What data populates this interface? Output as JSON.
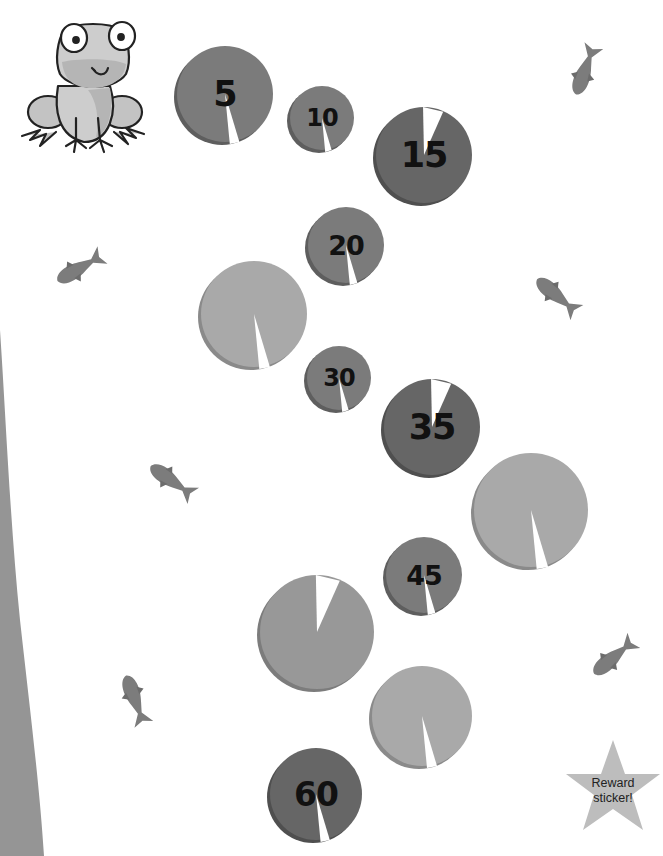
{
  "game": {
    "type": "lily-pad counting path (count by 5s)",
    "reward_label_line1": "Reward",
    "reward_label_line2": "sticker!"
  },
  "colors": {
    "background": "#ffffff",
    "pad_dark": "#6a6a6a",
    "pad_medium": "#7a7a7a",
    "pad_light": "#a8a8a8",
    "pad_edge_shadow": "#5a5a5a",
    "fish": "#7c7c7c",
    "bank": "#959595",
    "star": "#bdbdbd",
    "frog": "#c8c8c8"
  },
  "pads": [
    {
      "id": "pad-5",
      "label": "5",
      "cx": 225,
      "cy": 94,
      "r": 48,
      "shade": "medium",
      "notch": "bottom"
    },
    {
      "id": "pad-10",
      "label": "10",
      "cx": 322,
      "cy": 118,
      "r": 32,
      "shade": "medium",
      "notch": "bottom"
    },
    {
      "id": "pad-15",
      "label": "15",
      "cx": 424,
      "cy": 155,
      "r": 48,
      "shade": "dark",
      "notch": "top"
    },
    {
      "id": "pad-20",
      "label": "20",
      "cx": 346,
      "cy": 245,
      "r": 38,
      "shade": "medium",
      "notch": "bottom"
    },
    {
      "id": "pad-25",
      "label": "",
      "cx": 254,
      "cy": 314,
      "r": 53,
      "shade": "light",
      "notch": "bottom"
    },
    {
      "id": "pad-30",
      "label": "30",
      "cx": 339,
      "cy": 378,
      "r": 32,
      "shade": "medium",
      "notch": "bottom"
    },
    {
      "id": "pad-35",
      "label": "35",
      "cx": 432,
      "cy": 427,
      "r": 48,
      "shade": "dark",
      "notch": "top"
    },
    {
      "id": "pad-40",
      "label": "",
      "cx": 531,
      "cy": 510,
      "r": 57,
      "shade": "light",
      "notch": "bottom"
    },
    {
      "id": "pad-45",
      "label": "45",
      "cx": 424,
      "cy": 575,
      "r": 38,
      "shade": "medium",
      "notch": "bottom"
    },
    {
      "id": "pad-50",
      "label": "",
      "cx": 317,
      "cy": 632,
      "r": 57,
      "shade": "light2",
      "notch": "top"
    },
    {
      "id": "pad-55",
      "label": "",
      "cx": 422,
      "cy": 716,
      "r": 50,
      "shade": "light",
      "notch": "bottom"
    },
    {
      "id": "pad-60",
      "label": "60",
      "cx": 316,
      "cy": 794,
      "r": 46,
      "shade": "dark",
      "notch": "bottom"
    }
  ],
  "fish": [
    {
      "id": "fish-top-right",
      "x": 585,
      "y": 70,
      "angle": -70
    },
    {
      "id": "fish-left-upper",
      "x": 80,
      "y": 268,
      "angle": -30
    },
    {
      "id": "fish-right-middle",
      "x": 557,
      "y": 296,
      "angle": 40
    },
    {
      "id": "fish-left-middle",
      "x": 172,
      "y": 481,
      "angle": 35
    },
    {
      "id": "fish-right-lower",
      "x": 614,
      "y": 657,
      "angle": -40
    },
    {
      "id": "fish-left-lower",
      "x": 135,
      "y": 700,
      "angle": 70
    }
  ]
}
